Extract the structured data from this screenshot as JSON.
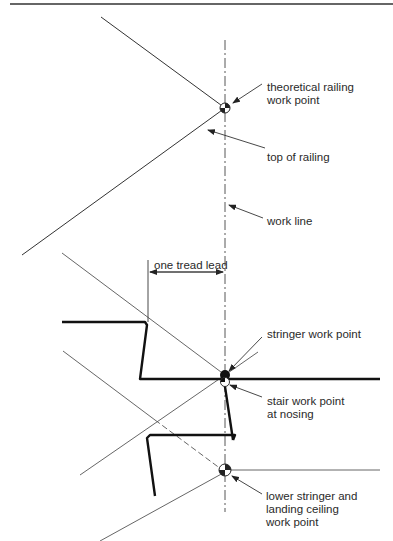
{
  "diagram": {
    "type": "stair stringer and railing work point layout",
    "colors": {
      "stroke": "#222222",
      "thin_stroke": "#555555",
      "background": "#ffffff"
    },
    "labels": {
      "theoretical_railing_work_point": [
        "theoretical railing",
        "work point"
      ],
      "top_of_railing": "top of railing",
      "work_line": "work line",
      "one_tread_lead": "one tread lead",
      "stringer_work_point": "stringer work point",
      "stair_work_point_at_nosing": [
        "stair work point",
        "at nosing"
      ],
      "lower_stringer_and_landing_ceiling_work_point": [
        "lower stringer and",
        "landing ceiling",
        "work point"
      ]
    }
  }
}
